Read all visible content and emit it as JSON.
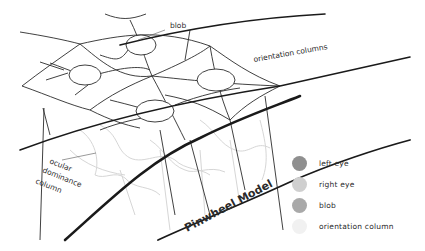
{
  "diagram": {
    "title": "Pinwheel Model",
    "labels": {
      "blob": "blob",
      "orientation_columns": "orientation columns",
      "ocular_dominance_line1": "ocular",
      "ocular_dominance_line2": "dominance",
      "ocular_dominance_line3": "column"
    }
  },
  "legend": {
    "items": [
      {
        "label": "left eye",
        "color": "#8f8f8f"
      },
      {
        "label": "right eye",
        "color": "#cfcfcf"
      },
      {
        "label": "blob",
        "color": "#a9a9a9"
      },
      {
        "label": "orientation column",
        "color": "#f1f1f1"
      }
    ]
  },
  "colors": {
    "stroke": "#2b2b2b",
    "faint": "#d0d0d0",
    "background": "#ffffff"
  }
}
